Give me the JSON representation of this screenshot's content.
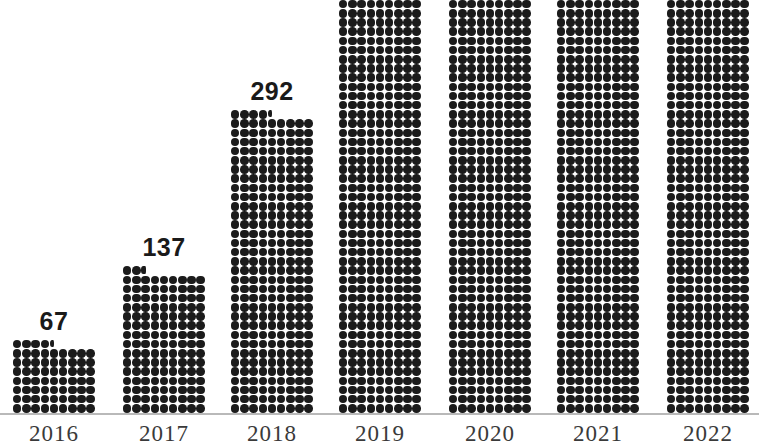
{
  "chart_data": {
    "type": "bar",
    "title": "",
    "subtitle": "",
    "xlabel": "",
    "ylabel": "",
    "categories": [
      "2016",
      "2017",
      "2018",
      "2019",
      "2020",
      "2021",
      "2022"
    ],
    "values": [
      67,
      137,
      292,
      441,
      507,
      612,
      702
    ],
    "data_labels": [
      "67",
      "137",
      "292",
      "441",
      "507",
      "612",
      "702"
    ],
    "ylim": [
      0,
      702
    ],
    "grid": false,
    "legend": null,
    "style": "dot-matrix pictogram bars, 9 dots per row, each dot represents one unit",
    "dots_per_row": 9,
    "series": [
      {
        "name": "",
        "values": [
          67,
          137,
          292,
          441,
          507,
          612,
          702
        ]
      }
    ],
    "colors": {
      "dot": "#1b1b1b",
      "background": "#ffffff",
      "axis_line": "#b9b9b9",
      "value_label": "#1a1a1a",
      "tick_label": "#3a3a3a"
    }
  },
  "axis": {
    "baseline_visible": true
  }
}
